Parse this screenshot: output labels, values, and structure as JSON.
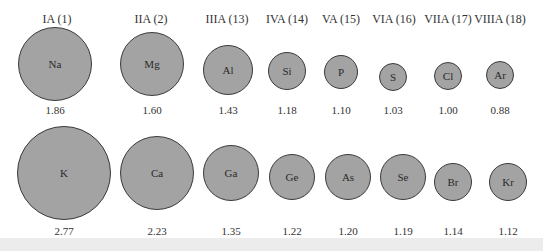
{
  "chart_data": {
    "type": "scatter",
    "title": "",
    "groups": [
      "IA (1)",
      "IIA (2)",
      "IIIA (13)",
      "IVA (14)",
      "VA (15)",
      "VIA (16)",
      "VIIA (17)",
      "VIIIA (18)"
    ],
    "series": [
      {
        "name": "Period 3",
        "elements": [
          "Na",
          "Mg",
          "Al",
          "Si",
          "P",
          "S",
          "Cl",
          "Ar"
        ],
        "values": [
          1.86,
          1.6,
          1.43,
          1.18,
          1.1,
          1.03,
          1.0,
          0.88
        ]
      },
      {
        "name": "Period 4",
        "elements": [
          "K",
          "Ca",
          "Ga",
          "Ge",
          "As",
          "Se",
          "Br",
          "Kr"
        ],
        "values": [
          2.77,
          2.23,
          1.35,
          1.22,
          1.2,
          1.19,
          1.14,
          1.12
        ]
      }
    ]
  },
  "colors": {
    "circle_fill": "#a3a3a3",
    "circle_stroke": "#3a3a3a",
    "background": "#ffffff",
    "bottom_band": "#ececec"
  },
  "headers": [
    {
      "label": "IA (1)",
      "x": 57,
      "y": 19
    },
    {
      "label": "IIA (2)",
      "x": 151,
      "y": 19
    },
    {
      "label": "IIIA (13)",
      "x": 227,
      "y": 19
    },
    {
      "label": "IVA (14)",
      "x": 287,
      "y": 19
    },
    {
      "label": "VA (15)",
      "x": 341,
      "y": 19
    },
    {
      "label": "VIA (16)",
      "x": 394,
      "y": 19
    },
    {
      "label": "VIIA (17)",
      "x": 448,
      "y": 19
    },
    {
      "label": "VIIIA (18)",
      "x": 500,
      "y": 19
    }
  ],
  "rows": [
    {
      "atoms": [
        {
          "symbol": "Na",
          "radius_value": "1.86",
          "cx": 55,
          "cy": 64,
          "r": 37,
          "label_y": 110
        },
        {
          "symbol": "Mg",
          "radius_value": "1.60",
          "cx": 152,
          "cy": 64,
          "r": 32,
          "label_y": 110
        },
        {
          "symbol": "Al",
          "radius_value": "1.43",
          "cx": 228,
          "cy": 70,
          "r": 25,
          "label_y": 110
        },
        {
          "symbol": "Si",
          "radius_value": "1.18",
          "cx": 287,
          "cy": 71,
          "r": 19,
          "label_y": 110
        },
        {
          "symbol": "P",
          "radius_value": "1.10",
          "cx": 341,
          "cy": 72,
          "r": 17,
          "label_y": 110
        },
        {
          "symbol": "S",
          "radius_value": "1.03",
          "cx": 393,
          "cy": 77,
          "r": 14,
          "label_y": 110
        },
        {
          "symbol": "Cl",
          "radius_value": "1.00",
          "cx": 448,
          "cy": 76,
          "r": 14,
          "label_y": 110
        },
        {
          "symbol": "Ar",
          "radius_value": "0.88",
          "cx": 500,
          "cy": 75,
          "r": 14,
          "label_y": 110
        }
      ]
    },
    {
      "atoms": [
        {
          "symbol": "K",
          "radius_value": "2.77",
          "cx": 64,
          "cy": 173,
          "r": 47,
          "label_y": 231
        },
        {
          "symbol": "Ca",
          "radius_value": "2.23",
          "cx": 157,
          "cy": 173,
          "r": 37,
          "label_y": 231
        },
        {
          "symbol": "Ga",
          "radius_value": "1.35",
          "cx": 231,
          "cy": 173,
          "r": 28,
          "label_y": 231
        },
        {
          "symbol": "Ge",
          "radius_value": "1.22",
          "cx": 292,
          "cy": 177,
          "r": 23,
          "label_y": 231
        },
        {
          "symbol": "As",
          "radius_value": "1.20",
          "cx": 348,
          "cy": 177,
          "r": 23,
          "label_y": 231
        },
        {
          "symbol": "Se",
          "radius_value": "1.19",
          "cx": 403,
          "cy": 177,
          "r": 23,
          "label_y": 231
        },
        {
          "symbol": "Br",
          "radius_value": "1.14",
          "cx": 453,
          "cy": 182,
          "r": 19,
          "label_y": 231
        },
        {
          "symbol": "Kr",
          "radius_value": "1.12",
          "cx": 508,
          "cy": 182,
          "r": 19,
          "label_y": 231
        }
      ]
    }
  ]
}
